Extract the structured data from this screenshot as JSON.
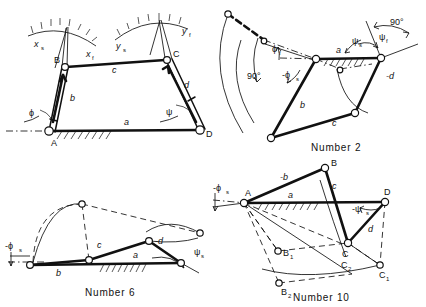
{
  "document": {
    "kind": "engineering-figure-plate",
    "description": "Four-bar linkage kinematic diagrams with link and angle notation"
  },
  "figures": [
    {
      "id": "fig-top-left",
      "caption": "",
      "joint_labels": [
        "A",
        "B",
        "C",
        "D"
      ],
      "link_labels": [
        "a",
        "b",
        "c",
        "d"
      ],
      "angle_labels": [
        "ϕ",
        "ψ"
      ],
      "axis_labels": [
        "x",
        "x",
        "y",
        "y"
      ],
      "axis_label_main": [
        "x",
        "x",
        "y",
        "y"
      ],
      "axis_sub": [
        "s",
        "f",
        "s",
        "f"
      ],
      "scale_label_xs": "x",
      "scale_sub_xs": "s",
      "scale_label_xf": "x",
      "scale_sub_xf": "f",
      "scale_label_ys": "y",
      "scale_sub_ys": "s",
      "scale_label_yf": "y",
      "scale_sub_yf": "f",
      "label_A": "A",
      "label_B": "B",
      "label_C": "C",
      "label_D": "D",
      "label_a": "a",
      "label_b": "b",
      "label_c": "c",
      "label_d": "d",
      "label_phi": "ϕ",
      "label_psi": "ψ"
    },
    {
      "id": "fig-number-2",
      "caption": "Number 2",
      "label_a": "a",
      "label_b": "b",
      "label_c": "c",
      "label_neg_d": "-d",
      "label_phi_f": "ϕ",
      "sub_phi_f": "f",
      "label_neg_phi_s": "-ϕ",
      "sub_neg_phi_s": "s",
      "label_psi_s": "ψ",
      "sub_psi_s": "s",
      "label_psi_f": "ψ",
      "sub_psi_f": "f",
      "label_right_angle_1": "90°",
      "label_right_angle_2": "90°"
    },
    {
      "id": "fig-number-6",
      "caption": "Number 6",
      "label_a": "a",
      "label_b": "b",
      "label_c": "c",
      "label_neg_d": "-d",
      "label_neg_phi_s": "-ϕ",
      "sub_neg_phi_s": "s",
      "label_psi_s": "ψ",
      "sub_psi_s": "s"
    },
    {
      "id": "fig-number-10",
      "caption": "Number 10",
      "label_A": "A",
      "label_B": "B",
      "label_C": "C",
      "label_D": "D",
      "label_B1": "B",
      "sub_B1": "1",
      "label_B2": "B",
      "sub_B2": "2",
      "label_C1": "C",
      "sub_C1": "1",
      "label_C2": "C",
      "sub_C2": "2",
      "label_a": "a",
      "label_neg_b": "-b",
      "label_c": "c",
      "label_d": "d",
      "label_neg_phi_s": "-ϕ",
      "sub_neg_phi_s": "s",
      "label_neg_psi_s": "-ψ",
      "sub_neg_psi_s": "s"
    }
  ],
  "colors": {
    "ink": "#111111",
    "paper": "#ffffff"
  }
}
